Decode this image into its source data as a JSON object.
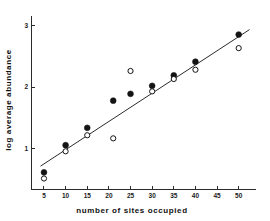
{
  "chart_data": {
    "type": "scatter",
    "title": "",
    "xlabel": "number of sites occupied",
    "ylabel": "log average abundance",
    "xlim": [
      2,
      54
    ],
    "ylim": [
      0.35,
      3.15
    ],
    "xticks": [
      5,
      10,
      15,
      20,
      25,
      30,
      35,
      40,
      45,
      50
    ],
    "yticks": [
      1,
      2,
      3
    ],
    "xtick_labels": [
      "5",
      "10",
      "15",
      "20",
      "25",
      "30",
      "35",
      "40",
      "45",
      "50"
    ],
    "ytick_labels": [
      "1",
      "2",
      "3"
    ],
    "grid": false,
    "legend": false,
    "series": [
      {
        "name": "filled",
        "marker": "filled-circle",
        "color": "#141414",
        "points": [
          {
            "x": 5,
            "y": 0.62
          },
          {
            "x": 10,
            "y": 1.06
          },
          {
            "x": 15,
            "y": 1.34
          },
          {
            "x": 21,
            "y": 1.78
          },
          {
            "x": 25,
            "y": 1.89
          },
          {
            "x": 30,
            "y": 2.02
          },
          {
            "x": 35,
            "y": 2.19
          },
          {
            "x": 40,
            "y": 2.41
          },
          {
            "x": 50,
            "y": 2.85
          }
        ]
      },
      {
        "name": "open",
        "marker": "open-circle",
        "color": "#ffffff",
        "points": [
          {
            "x": 5,
            "y": 0.52
          },
          {
            "x": 10,
            "y": 0.96
          },
          {
            "x": 15,
            "y": 1.22
          },
          {
            "x": 21,
            "y": 1.17
          },
          {
            "x": 25,
            "y": 2.26
          },
          {
            "x": 30,
            "y": 1.93
          },
          {
            "x": 35,
            "y": 2.13
          },
          {
            "x": 40,
            "y": 2.28
          },
          {
            "x": 50,
            "y": 2.63
          }
        ]
      }
    ],
    "fit_line": {
      "name": "regression-line",
      "x_start": 4.2,
      "y_start": 0.72,
      "x_end": 52.5,
      "y_end": 2.93,
      "color": "#2b2b2b"
    }
  }
}
